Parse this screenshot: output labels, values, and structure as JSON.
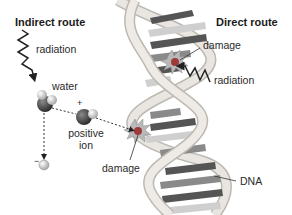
{
  "titles": {
    "indirect": "Indirect route",
    "direct": "Direct route"
  },
  "labels": {
    "radiation_indirect": "radiation",
    "water": "water",
    "plus_sign": "+",
    "positive_ion_line1": "positive",
    "positive_ion_line2": "ion",
    "minus_sign": "−",
    "damage_lower": "damage",
    "damage_upper": "damage",
    "radiation_direct": "radiation",
    "dna": "DNA"
  },
  "colors": {
    "backbone": "#e6e3de",
    "backbone_edge": "#bdb9b2",
    "base_dark": "#555555",
    "base_mid": "#8a8a8a",
    "base_light": "#cfcfcf",
    "damage_red": "#9e3a3a",
    "damage_burst": "#b9b9b9",
    "molecule_dark": "#3c3c3c",
    "molecule_light": "#d9d9d9"
  }
}
